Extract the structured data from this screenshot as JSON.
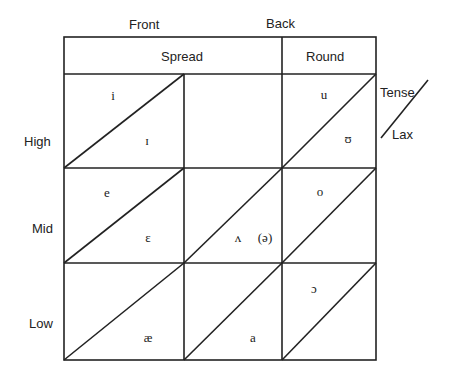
{
  "diagram": {
    "type": "vowel-chart",
    "column_headers": {
      "front": "Front",
      "back": "Back",
      "spread": "Spread",
      "round": "Round"
    },
    "row_labels": {
      "high": "High",
      "mid": "Mid",
      "low": "Low"
    },
    "legend": {
      "tense": "Tense",
      "lax": "Lax"
    },
    "vowels": {
      "high_front_tense": "i",
      "high_front_lax": "ɪ",
      "high_back_tense": "u",
      "high_back_lax": "ʊ",
      "mid_front_tense": "e",
      "mid_front_lax": "ɛ",
      "mid_central_lax": "ʌ",
      "mid_central_schwa": "(ə)",
      "mid_back_tense": "o",
      "low_front_lax": "æ",
      "low_central_lax": "a",
      "low_back_tense": "ɔ"
    },
    "colors": {
      "line": "#222222",
      "text": "#222222",
      "background": "#ffffff"
    }
  }
}
